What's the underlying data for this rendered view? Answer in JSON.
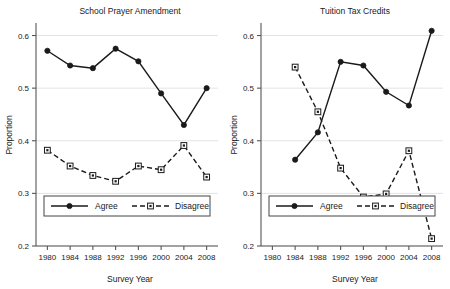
{
  "figure": {
    "width": 450,
    "height": 289,
    "background": "#ffffff",
    "line_color": "#1a1a1a",
    "grid_color": "#e3e3e3",
    "axis_color": "#555555"
  },
  "chart_data": [
    {
      "type": "line",
      "panel_index": 0,
      "title": "School Prayer Amendment",
      "xlabel": "Survey Year",
      "ylabel": "Proportion",
      "x": [
        1980,
        1984,
        1988,
        1992,
        1996,
        2000,
        2004,
        2008
      ],
      "categories": [
        "1980",
        "1984",
        "1988",
        "1992",
        "1996",
        "2000",
        "2004",
        "2008"
      ],
      "xlim": [
        1978,
        2010
      ],
      "ylim": [
        0.2,
        0.62
      ],
      "yticks": [
        0.2,
        0.3,
        0.4,
        0.5,
        0.6
      ],
      "ytick_labels": [
        "0.2",
        "0.3",
        "0.4",
        "0.5",
        "0.6"
      ],
      "xticks": [
        1980,
        1984,
        1988,
        1992,
        1996,
        2000,
        2004,
        2008
      ],
      "grid": "horizontal",
      "legend_position": "lower-left",
      "series": [
        {
          "name": "Agree",
          "marker": "filled-circle",
          "linestyle": "solid",
          "x": [
            1980,
            1984,
            1988,
            1992,
            1996,
            2000,
            2004,
            2008
          ],
          "values": [
            0.571,
            0.543,
            0.538,
            0.575,
            0.551,
            0.49,
            0.43,
            0.5
          ]
        },
        {
          "name": "Disagree",
          "marker": "hollow-square",
          "linestyle": "dashed",
          "x": [
            1980,
            1984,
            1988,
            1992,
            1996,
            2000,
            2004,
            2008
          ],
          "values": [
            0.382,
            0.352,
            0.334,
            0.323,
            0.352,
            0.345,
            0.391,
            0.331
          ]
        }
      ]
    },
    {
      "type": "line",
      "panel_index": 1,
      "title": "Tuition Tax Credits",
      "xlabel": "Survey Year",
      "ylabel": "Proportion",
      "x": [
        1984,
        1988,
        1992,
        1996,
        2000,
        2004,
        2008
      ],
      "categories": [
        "1980",
        "1984",
        "1988",
        "1992",
        "1996",
        "2000",
        "2004",
        "2008"
      ],
      "xlim": [
        1978,
        2010
      ],
      "ylim": [
        0.2,
        0.62
      ],
      "yticks": [
        0.2,
        0.3,
        0.4,
        0.5,
        0.6
      ],
      "ytick_labels": [
        "0.2",
        "0.3",
        "0.4",
        "0.5",
        "0.6"
      ],
      "xticks": [
        1980,
        1984,
        1988,
        1992,
        1996,
        2000,
        2004,
        2008
      ],
      "grid": "horizontal",
      "legend_position": "lower-left",
      "series": [
        {
          "name": "Agree",
          "marker": "filled-circle",
          "linestyle": "solid",
          "x": [
            1984,
            1988,
            1992,
            1996,
            2000,
            2004,
            2008
          ],
          "values": [
            0.364,
            0.416,
            0.55,
            0.543,
            0.493,
            0.467,
            0.609
          ]
        },
        {
          "name": "Disagree",
          "marker": "hollow-square",
          "linestyle": "dashed",
          "x": [
            1984,
            1988,
            1992,
            1996,
            2000,
            2004,
            2008
          ],
          "values": [
            0.54,
            0.455,
            0.348,
            0.293,
            0.299,
            0.381,
            0.214
          ]
        }
      ]
    }
  ],
  "panels": [
    {
      "title": "School Prayer Amendment",
      "ylabel": "Proportion",
      "xlabel": "Survey Year",
      "ytick_labels": [
        "0.6",
        "0.5",
        "0.4",
        "0.3",
        "0.2"
      ],
      "xtick_labels": [
        "1980",
        "1984",
        "1988",
        "1992",
        "1996",
        "2000",
        "2004",
        "2008"
      ],
      "legend": {
        "agree": "Agree",
        "disagree": "Disagree"
      }
    },
    {
      "title": "Tuition Tax Credits",
      "ylabel": "Proportion",
      "xlabel": "Survey Year",
      "ytick_labels": [
        "0.6",
        "0.5",
        "0.4",
        "0.3",
        "0.2"
      ],
      "xtick_labels": [
        "1980",
        "1984",
        "1988",
        "1992",
        "1996",
        "2000",
        "2004",
        "2008"
      ],
      "legend": {
        "agree": "Agree",
        "disagree": "Disagree"
      }
    }
  ]
}
